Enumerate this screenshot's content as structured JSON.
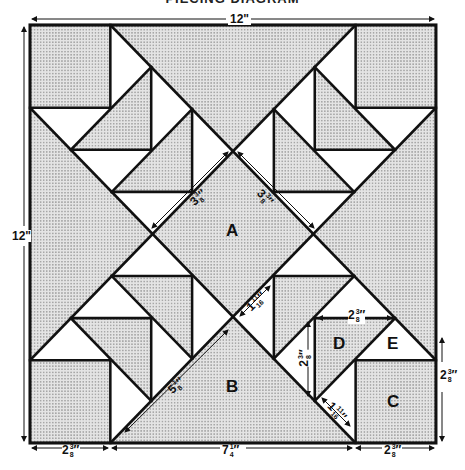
{
  "title": "PIECING DIAGRAM",
  "colors": {
    "shade": "#d9d9d9",
    "line": "#111111",
    "background": "#ffffff"
  },
  "block": {
    "width": "12\"",
    "height": "12\""
  },
  "pieces": [
    {
      "id": "A",
      "label": "A",
      "shape": "square (on point)"
    },
    {
      "id": "B",
      "label": "B",
      "shape": "large triangle"
    },
    {
      "id": "C",
      "label": "C",
      "shape": "corner square"
    },
    {
      "id": "D",
      "label": "D",
      "shape": "shaded triangle"
    },
    {
      "id": "E",
      "label": "E",
      "shape": "white triangle"
    }
  ],
  "labels": {
    "top_width": "12\"",
    "left_height": "12\"",
    "a_side_left": {
      "whole": "3",
      "num": "3",
      "den": "8"
    },
    "a_side_right": {
      "whole": "3",
      "num": "3",
      "den": "8"
    },
    "mid_small": {
      "whole": "1",
      "num": "11",
      "den": "16"
    },
    "b_side": {
      "whole": "5",
      "num": "1",
      "den": "8"
    },
    "d_top": {
      "whole": "2",
      "num": "3",
      "den": "8"
    },
    "d_side": {
      "whole": "2",
      "num": "3",
      "den": "8"
    },
    "e_small": {
      "whole": "1",
      "num": "11",
      "den": "16"
    },
    "c_side": {
      "whole": "2",
      "num": "3",
      "den": "8"
    },
    "bottom_left": {
      "whole": "2",
      "num": "3",
      "den": "8"
    },
    "bottom_mid": {
      "whole": "7",
      "num": "1",
      "den": "4"
    },
    "bottom_right": {
      "whole": "2",
      "num": "3",
      "den": "8"
    }
  }
}
